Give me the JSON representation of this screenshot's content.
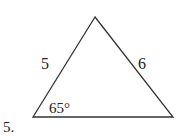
{
  "problem": {
    "number_label": "5.",
    "figure_type": "triangle",
    "side_left_label": "5",
    "side_right_label": "6",
    "angle_label": "65°",
    "angle_location": "bottom-left vertex",
    "vertices": {
      "apex": [
        95,
        17
      ],
      "bottom_left": [
        33,
        117
      ],
      "bottom_right": [
        173,
        117
      ]
    },
    "stroke_color": "#333333",
    "background_color": "#ffffff"
  }
}
